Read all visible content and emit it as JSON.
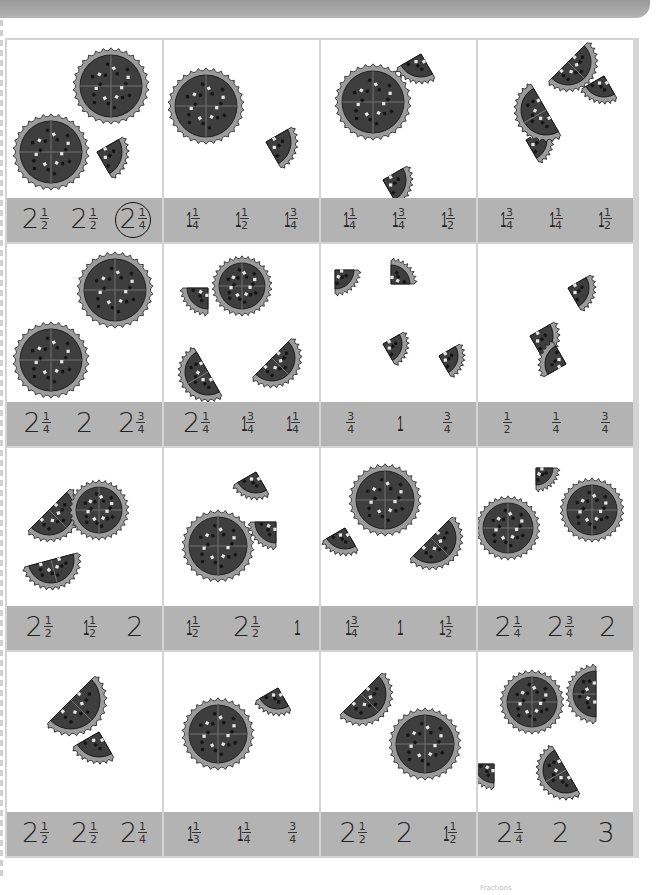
{
  "page": {
    "instructions_visible": false,
    "footer_text": "Fractions"
  },
  "colors": {
    "band": "#b3b3b3",
    "grid_line": "#d4d4d4",
    "pizza_crust": "#9b9b9b",
    "pizza_top": "#3e3e3e",
    "text": "#222222"
  },
  "cells": [
    {
      "pieces": [
        {
          "t": "w",
          "x": 104,
          "y": 46,
          "r": 36
        },
        {
          "t": "w",
          "x": 44,
          "y": 112,
          "r": 36
        },
        {
          "t": "q",
          "x": 90,
          "y": 112,
          "r": 30,
          "rot": -30
        }
      ],
      "options": [
        {
          "w": "2",
          "n": "1",
          "d": "2"
        },
        {
          "w": "2",
          "n": "1",
          "d": "2"
        },
        {
          "w": "2",
          "n": "1",
          "d": "4",
          "circled": true
        }
      ]
    },
    {
      "pieces": [
        {
          "t": "w",
          "x": 42,
          "y": 66,
          "r": 36
        },
        {
          "t": "q",
          "x": 102,
          "y": 102,
          "r": 30,
          "rot": -30
        }
      ],
      "options": [
        {
          "w": "1",
          "n": "1",
          "d": "4"
        },
        {
          "w": "1",
          "n": "1",
          "d": "2"
        },
        {
          "w": "1",
          "n": "3",
          "d": "4"
        }
      ]
    },
    {
      "pieces": [
        {
          "t": "w",
          "x": 52,
          "y": 62,
          "r": 36
        },
        {
          "t": "q",
          "x": 100,
          "y": 14,
          "r": 28,
          "rot": 60
        },
        {
          "t": "q",
          "x": 62,
          "y": 140,
          "r": 28,
          "rot": -30
        }
      ],
      "options": [
        {
          "w": "1",
          "n": "1",
          "d": "4"
        },
        {
          "w": "1",
          "n": "3",
          "d": "4"
        },
        {
          "w": "1",
          "n": "1",
          "d": "2"
        }
      ]
    },
    {
      "pieces": [
        {
          "t": "h",
          "x": 90,
          "y": 22,
          "r": 28,
          "rot": -45
        },
        {
          "t": "q",
          "x": 126,
          "y": 36,
          "r": 26,
          "rot": 60
        },
        {
          "t": "q",
          "x": 48,
          "y": 100,
          "r": 26,
          "rot": -30
        },
        {
          "t": "h",
          "x": 68,
          "y": 70,
          "r": 30,
          "rot": 60
        }
      ],
      "options": [
        {
          "w": "1",
          "n": "3",
          "d": "4"
        },
        {
          "w": "1",
          "n": "1",
          "d": "4"
        },
        {
          "w": "1",
          "n": "1",
          "d": "2"
        }
      ]
    },
    {
      "pieces": [
        {
          "t": "w",
          "x": 108,
          "y": 46,
          "r": 36
        },
        {
          "t": "w",
          "x": 44,
          "y": 116,
          "r": 36
        }
      ],
      "options": [
        {
          "w": "2",
          "n": "1",
          "d": "4"
        },
        {
          "w": "2",
          "n": "",
          "d": ""
        },
        {
          "w": "2",
          "n": "3",
          "d": "4"
        }
      ]
    },
    {
      "pieces": [
        {
          "t": "w",
          "x": 78,
          "y": 42,
          "r": 28
        },
        {
          "t": "q",
          "x": 44,
          "y": 44,
          "r": 26,
          "rot": 90
        },
        {
          "t": "h",
          "x": 44,
          "y": 128,
          "r": 28,
          "rot": 60
        },
        {
          "t": "h",
          "x": 108,
          "y": 114,
          "r": 28,
          "rot": -45
        }
      ],
      "options": [
        {
          "w": "2",
          "n": "1",
          "d": "4"
        },
        {
          "w": "1",
          "n": "3",
          "d": "4"
        },
        {
          "w": "1",
          "n": "1",
          "d": "4"
        }
      ]
    },
    {
      "pieces": [
        {
          "t": "q",
          "x": 14,
          "y": 26,
          "r": 24,
          "rot": 0
        },
        {
          "t": "q",
          "x": 70,
          "y": 40,
          "r": 24,
          "rot": -90
        },
        {
          "t": "q",
          "x": 62,
          "y": 100,
          "r": 24,
          "rot": -30
        },
        {
          "t": "q",
          "x": 118,
          "y": 112,
          "r": 24,
          "rot": -30
        }
      ],
      "options": [
        {
          "w": "",
          "n": "3",
          "d": "4"
        },
        {
          "w": "1",
          "n": "",
          "d": ""
        },
        {
          "w": "",
          "n": "3",
          "d": "4"
        }
      ]
    },
    {
      "pieces": [
        {
          "t": "q",
          "x": 90,
          "y": 44,
          "r": 26,
          "rot": -30
        },
        {
          "t": "q",
          "x": 52,
          "y": 92,
          "r": 28,
          "rot": -30
        },
        {
          "t": "q",
          "x": 88,
          "y": 120,
          "r": 26,
          "rot": 150
        }
      ],
      "options": [
        {
          "w": "",
          "n": "1",
          "d": "2"
        },
        {
          "w": "",
          "n": "1",
          "d": "4"
        },
        {
          "w": "",
          "n": "3",
          "d": "4"
        }
      ]
    },
    {
      "pieces": [
        {
          "t": "h",
          "x": 42,
          "y": 62,
          "r": 30,
          "rot": -45
        },
        {
          "t": "w",
          "x": 92,
          "y": 62,
          "r": 28
        },
        {
          "t": "h",
          "x": 44,
          "y": 112,
          "r": 28,
          "rot": -15
        }
      ],
      "options": [
        {
          "w": "2",
          "n": "1",
          "d": "2"
        },
        {
          "w": "1",
          "n": "1",
          "d": "2"
        },
        {
          "w": "2",
          "n": "",
          "d": ""
        }
      ]
    },
    {
      "pieces": [
        {
          "t": "q",
          "x": 92,
          "y": 24,
          "r": 26,
          "rot": 60
        },
        {
          "t": "w",
          "x": 54,
          "y": 98,
          "r": 34
        },
        {
          "t": "q",
          "x": 112,
          "y": 74,
          "r": 26,
          "rot": 90
        }
      ],
      "options": [
        {
          "w": "1",
          "n": "1",
          "d": "2"
        },
        {
          "w": "2",
          "n": "1",
          "d": "2"
        },
        {
          "w": "1",
          "n": "",
          "d": ""
        }
      ]
    },
    {
      "pieces": [
        {
          "t": "w",
          "x": 64,
          "y": 52,
          "r": 34
        },
        {
          "t": "q",
          "x": 24,
          "y": 80,
          "r": 26,
          "rot": 60
        },
        {
          "t": "h",
          "x": 110,
          "y": 90,
          "r": 30,
          "rot": -45
        }
      ],
      "options": [
        {
          "w": "1",
          "n": "3",
          "d": "4"
        },
        {
          "w": "1",
          "n": "",
          "d": ""
        },
        {
          "w": "1",
          "n": "1",
          "d": "2"
        }
      ]
    },
    {
      "pieces": [
        {
          "t": "q",
          "x": 58,
          "y": 20,
          "r": 22,
          "rot": 0
        },
        {
          "t": "w",
          "x": 30,
          "y": 80,
          "r": 30
        },
        {
          "t": "w",
          "x": 114,
          "y": 62,
          "r": 30
        }
      ],
      "options": [
        {
          "w": "2",
          "n": "1",
          "d": "4"
        },
        {
          "w": "2",
          "n": "3",
          "d": "4"
        },
        {
          "w": "2",
          "n": "",
          "d": ""
        }
      ]
    },
    {
      "pieces": [
        {
          "t": "h",
          "x": 64,
          "y": 48,
          "r": 34,
          "rot": -45
        },
        {
          "t": "q",
          "x": 92,
          "y": 80,
          "r": 30,
          "rot": 60
        }
      ],
      "options": [
        {
          "w": "2",
          "n": "1",
          "d": "2"
        },
        {
          "w": "2",
          "n": "1",
          "d": "2"
        },
        {
          "w": "2",
          "n": "1",
          "d": "4"
        }
      ]
    },
    {
      "pieces": [
        {
          "t": "w",
          "x": 54,
          "y": 82,
          "r": 34
        },
        {
          "t": "q",
          "x": 114,
          "y": 36,
          "r": 26,
          "rot": 60
        }
      ],
      "options": [
        {
          "w": "1",
          "n": "1",
          "d": "3"
        },
        {
          "w": "1",
          "n": "1",
          "d": "4"
        },
        {
          "w": "",
          "n": "3",
          "d": "4"
        }
      ]
    },
    {
      "pieces": [
        {
          "t": "h",
          "x": 40,
          "y": 42,
          "r": 30,
          "rot": -45
        },
        {
          "t": "w",
          "x": 104,
          "y": 92,
          "r": 34
        }
      ],
      "options": [
        {
          "w": "2",
          "n": "1",
          "d": "2"
        },
        {
          "w": "2",
          "n": "",
          "d": ""
        },
        {
          "w": "1",
          "n": "1",
          "d": "2"
        }
      ]
    },
    {
      "pieces": [
        {
          "t": "w",
          "x": 54,
          "y": 50,
          "r": 30
        },
        {
          "t": "h",
          "x": 118,
          "y": 42,
          "r": 28,
          "rot": 90
        },
        {
          "t": "q",
          "x": 16,
          "y": 112,
          "r": 24,
          "rot": 90
        },
        {
          "t": "h",
          "x": 88,
          "y": 118,
          "r": 28,
          "rot": 60
        }
      ],
      "options": [
        {
          "w": "2",
          "n": "1",
          "d": "4"
        },
        {
          "w": "2",
          "n": "",
          "d": ""
        },
        {
          "w": "3",
          "n": "",
          "d": ""
        }
      ]
    }
  ]
}
